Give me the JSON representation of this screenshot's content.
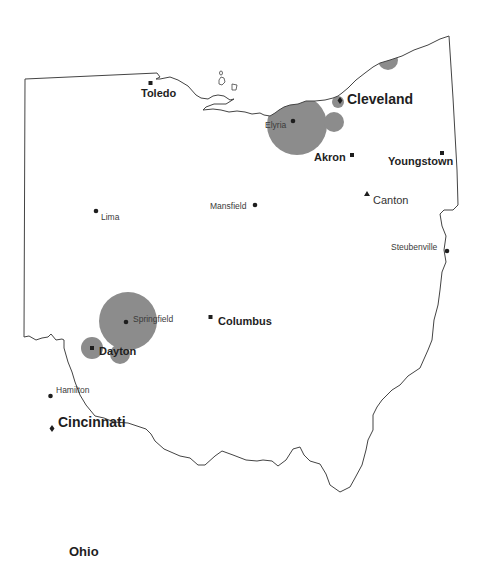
{
  "map": {
    "title": "Ohio",
    "state_outline_color": "#444444",
    "circle_color": "#8c8c8c",
    "marker_color": "#1e1e1e"
  },
  "cities": [
    {
      "id": "toledo",
      "name": "Toledo",
      "marker": "square",
      "label_style": "mid"
    },
    {
      "id": "cleveland",
      "name": "Cleveland",
      "marker": "diamond",
      "label_style": "big"
    },
    {
      "id": "elyria",
      "name": "Elyria",
      "marker": "dot",
      "label_style": "small"
    },
    {
      "id": "akron",
      "name": "Akron",
      "marker": "square",
      "label_style": "mid"
    },
    {
      "id": "youngstown",
      "name": "Youngstown",
      "marker": "square",
      "label_style": "mid"
    },
    {
      "id": "canton",
      "name": "Canton",
      "marker": "triangle",
      "label_style": "canton"
    },
    {
      "id": "mansfield",
      "name": "Mansfield",
      "marker": "dot",
      "label_style": "small"
    },
    {
      "id": "lima",
      "name": "Lima",
      "marker": "dot",
      "label_style": "small"
    },
    {
      "id": "steubenville",
      "name": "Steubenville",
      "marker": "dot",
      "label_style": "small"
    },
    {
      "id": "springfield",
      "name": "Springfield",
      "marker": "dot",
      "label_style": "small"
    },
    {
      "id": "columbus",
      "name": "Columbus",
      "marker": "square",
      "label_style": "mid"
    },
    {
      "id": "dayton",
      "name": "Dayton",
      "marker": "square",
      "label_style": "mid"
    },
    {
      "id": "hamilton",
      "name": "Hamilton",
      "marker": "dot",
      "label_style": "small"
    },
    {
      "id": "cincinnati",
      "name": "Cincinnati",
      "marker": "diamond",
      "label_style": "big"
    }
  ],
  "bubbles": [
    {
      "near": "Elyria",
      "size": "large"
    },
    {
      "near": "Cleveland",
      "size": "small"
    },
    {
      "near": "Cleveland (southeast)",
      "size": "medium"
    },
    {
      "near": "Ashtabula shore",
      "size": "medium"
    },
    {
      "near": "Springfield",
      "size": "large"
    },
    {
      "near": "Dayton (west)",
      "size": "medium"
    },
    {
      "near": "Dayton (east)",
      "size": "medium"
    }
  ]
}
